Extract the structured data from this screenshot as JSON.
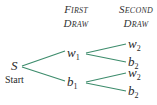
{
  "headers": {
    "first": {
      "line1": "First",
      "line2": "Draw"
    },
    "second": {
      "line1": "Second",
      "line2": "Draw"
    }
  },
  "root": {
    "symbol": "S",
    "label": "Start"
  },
  "level1": [
    {
      "symbol": "w",
      "sub": "1"
    },
    {
      "symbol": "b",
      "sub": "1"
    }
  ],
  "level2": [
    {
      "symbol": "w",
      "sub": "2"
    },
    {
      "symbol": "b",
      "sub": "2"
    },
    {
      "symbol": "w",
      "sub": "2"
    },
    {
      "symbol": "b",
      "sub": "2"
    }
  ],
  "colors": {
    "edge": "#3d8c6c",
    "text": "#2a2a2a"
  }
}
